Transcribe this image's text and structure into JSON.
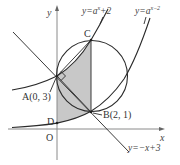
{
  "figure": {
    "axes": {
      "x_label": "x",
      "y_label": "y",
      "origin_label": "O"
    },
    "points": {
      "A": {
        "label": "A(0, 3)",
        "x": 0,
        "y": 3
      },
      "B": {
        "label": "B(2, 1)",
        "x": 2,
        "y": 1
      },
      "C": {
        "label": "C",
        "x": 2,
        "y": 5
      },
      "D": {
        "label": "D",
        "x": 0,
        "y": 0.3333
      }
    },
    "curves": [
      {
        "name": "y = a^x + 2",
        "label_base": "y=a",
        "label_exp": "x",
        "label_tail": "+2"
      },
      {
        "name": "y = a^(x-2)",
        "label_base": "y=a",
        "label_exp": "x−2",
        "label_tail": ""
      },
      {
        "name": "y = -x + 3",
        "label": "y=−x+3"
      }
    ],
    "circle": {
      "center": [
        2,
        3
      ],
      "radius": 2,
      "through": [
        "A",
        "B",
        "C"
      ]
    },
    "shaded_region": "between y=a^x+2 and y=a^(x-2), from x=0 to x=2",
    "right_angle_mark_at": "A",
    "parameter_a": "√3"
  }
}
